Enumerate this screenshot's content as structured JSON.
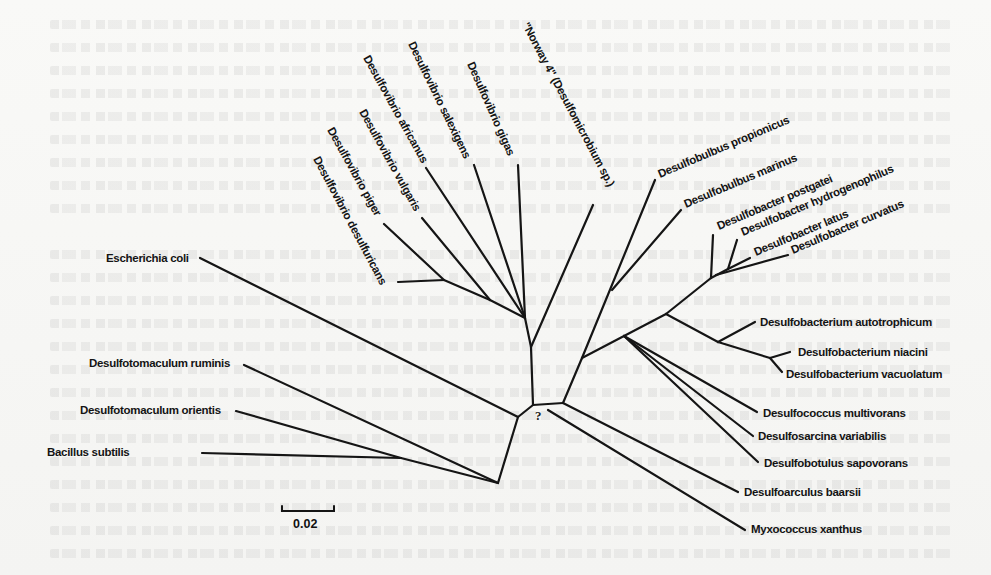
{
  "figure": {
    "type": "unrooted phylogenetic tree",
    "unresolved_root_marker": "?",
    "scale_bar": {
      "label": "0.02"
    },
    "taxa": {
      "e_coli": "Escherichia coli",
      "dtm_ruminis": "Desulfotomaculum ruminis",
      "dtm_orientis": "Desulfotomaculum orientis",
      "b_subtilis": "Bacillus subtilis",
      "dv_desulfuricans": "Desulfovibrio desulfuricans",
      "dv_piger": "Desulfovibrio piger",
      "dv_vulgaris": "Desulfovibrio vulgaris",
      "dv_africanus": "Desulfovibrio africanus",
      "dv_salexigens": "Desulfovibrio salexigens",
      "dv_gigas": "Desulfovibrio gigas",
      "norway4": "\"Norway 4\" (Desulfomicrobium sp.)",
      "dbb_propionicus": "Desulfobulbus propionicus",
      "dbb_marinus": "Desulfobulbus marinus",
      "dbc_postgatei": "Desulfobacter postgatei",
      "dbc_hydrogenophilus": "Desulfobacter hydrogenophilus",
      "dbc_latus": "Desulfobacter latus",
      "dbc_curvatus": "Desulfobacter curvatus",
      "dbm_autotrophicum": "Desulfobacterium autotrophicum",
      "dbm_niacini": "Desulfobacterium niacini",
      "dbm_vacuolatum": "Desulfobacterium vacuolatum",
      "dcc_multivorans": "Desulfococcus multivorans",
      "dsa_variabilis": "Desulfosarcina variabilis",
      "dbt_sapovorans": "Desulfobotulus sapovorans",
      "dac_baarsii": "Desulfoarculus baarsii",
      "myxo_xanthus": "Myxococcus xanthus"
    },
    "clades": [
      {
        "name": "Gram-positive / outgroup",
        "members": [
          "dtm_ruminis",
          "dtm_orientis",
          "b_subtilis"
        ]
      },
      {
        "name": "Outgroup",
        "members": [
          "e_coli"
        ]
      },
      {
        "name": "Desulfovibrio / Desulfomicrobium",
        "members": [
          "dv_desulfuricans",
          "dv_piger",
          "dv_vulgaris",
          "dv_africanus",
          "dv_salexigens",
          "dv_gigas",
          "norway4"
        ]
      },
      {
        "name": "Desulfobulbus",
        "members": [
          "dbb_propionicus",
          "dbb_marinus"
        ]
      },
      {
        "name": "Desulfobacter",
        "members": [
          "dbc_postgatei",
          "dbc_hydrogenophilus",
          "dbc_latus",
          "dbc_curvatus"
        ]
      },
      {
        "name": "Desulfobacterium",
        "members": [
          "dbm_autotrophicum",
          "dbm_niacini",
          "dbm_vacuolatum"
        ]
      },
      {
        "name": "Desulfococcus group",
        "members": [
          "dcc_multivorans",
          "dsa_variabilis",
          "dbt_sapovorans"
        ]
      },
      {
        "name": "Desulfoarculus / Myxococcus",
        "members": [
          "dac_baarsii",
          "myxo_xanthus"
        ]
      }
    ]
  },
  "colors": {
    "ink": "#151515",
    "paper": "#f7f7f5",
    "bleed_through": "#a0a0a0"
  }
}
